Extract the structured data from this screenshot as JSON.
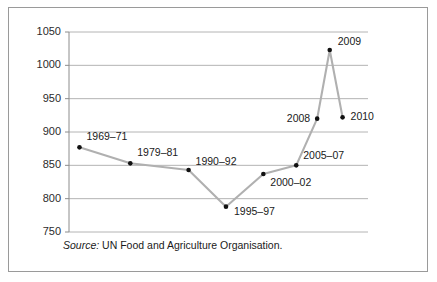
{
  "figure": {
    "source_label": "Source:",
    "source_text": "UN Food and Agriculture Organisation.",
    "border_color": "#9a9a9a",
    "line_color": "#b0b0b0",
    "marker_color": "#111111",
    "grid_color": "#b4b4b4"
  },
  "chart_data": {
    "type": "line",
    "title": "",
    "subtitle": "",
    "xlabel": "",
    "ylabel": "",
    "categories": [
      "1969–71",
      "1979–81",
      "1990–92",
      "1995–97",
      "2000–02",
      "2005–07",
      "2008",
      "2009",
      "2010"
    ],
    "values": [
      877,
      853,
      843,
      788,
      837,
      850,
      920,
      1023,
      922
    ],
    "point_labels": [
      "1969–71",
      "1979–81",
      "1990–92",
      "1995–97",
      "2000–02",
      "2005–07",
      "2008",
      "2009",
      "2010"
    ],
    "ylim": [
      750,
      1050
    ],
    "yticks": [
      750,
      800,
      850,
      900,
      950,
      1000,
      1050
    ],
    "ytick_labels": [
      "750",
      "800",
      "850",
      "900",
      "950",
      "1000",
      "1050"
    ],
    "grid": true,
    "legend": "none",
    "annotations": [
      "Source: UN Food and Agriculture Organisation."
    ]
  }
}
